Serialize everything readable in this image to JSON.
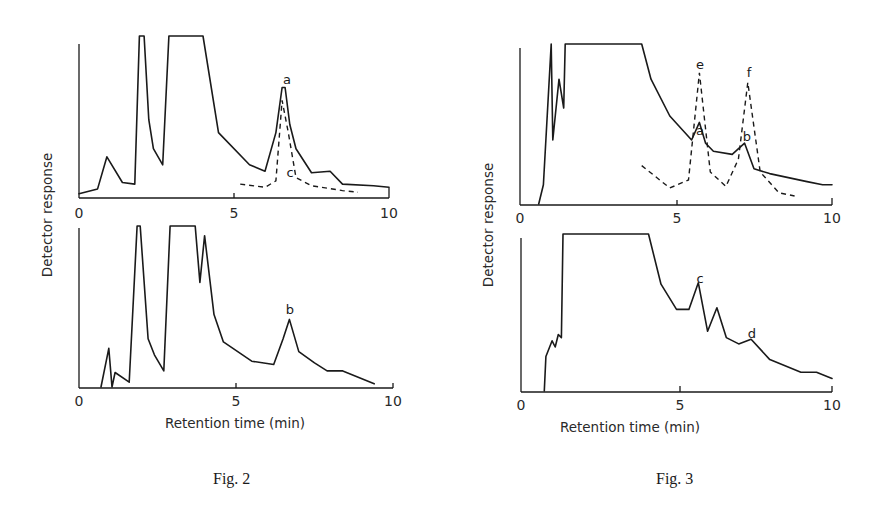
{
  "figures": [
    {
      "caption": "Fig. 2",
      "xlabel": "Retention time (min)",
      "ylabel": "Detector response",
      "panels": [
        {
          "x_ticks": [
            "0",
            "5",
            "10"
          ]
        },
        {
          "x_ticks": [
            "0",
            "5",
            "10"
          ]
        }
      ]
    },
    {
      "caption": "Fig. 3",
      "xlabel": "Retention time (min)",
      "ylabel": "Detector response",
      "panels": [
        {
          "x_ticks": [
            "0",
            "5",
            "10"
          ]
        },
        {
          "x_ticks": [
            "0",
            "5",
            "10"
          ]
        }
      ]
    }
  ],
  "chart_data": [
    {
      "type": "line",
      "title": "Fig. 2 (top panel)",
      "xlabel": "Retention time (min)",
      "ylabel": "Detector response",
      "xlim": [
        0,
        10
      ],
      "ylim": [
        0,
        1
      ],
      "x_ticks": [
        0,
        5,
        10
      ],
      "grid": false,
      "series": [
        {
          "name": "solid trace",
          "style": "solid",
          "x": [
            0,
            0.6,
            0.9,
            1.4,
            1.8,
            1.95,
            2.1,
            2.25,
            2.4,
            2.7,
            2.9,
            3.0,
            4.0,
            4.5,
            5.5,
            6.0,
            6.35,
            6.55,
            6.65,
            6.8,
            7.0,
            7.5,
            8.1,
            8.5,
            9.5,
            10.0
          ],
          "y": [
            0.02,
            0.05,
            0.25,
            0.09,
            0.08,
            1.0,
            1.0,
            0.48,
            0.3,
            0.2,
            1.0,
            1.0,
            1.0,
            0.4,
            0.2,
            0.16,
            0.4,
            0.68,
            0.68,
            0.45,
            0.3,
            0.15,
            0.16,
            0.08,
            0.07,
            0.06
          ],
          "labels": [
            {
              "text": "a",
              "x": 6.6
            }
          ]
        },
        {
          "name": "dashed trace",
          "style": "dashed",
          "x": [
            5.2,
            6.0,
            6.35,
            6.55,
            6.75,
            7.0,
            7.5,
            8.5,
            9.0
          ],
          "y": [
            0.08,
            0.06,
            0.1,
            0.6,
            0.4,
            0.12,
            0.07,
            0.04,
            0.03
          ],
          "labels": [
            {
              "text": "c",
              "x": 6.6
            }
          ]
        }
      ]
    },
    {
      "type": "line",
      "title": "Fig. 2 (bottom panel)",
      "xlabel": "Retention time (min)",
      "ylabel": "Detector response",
      "xlim": [
        0,
        10
      ],
      "ylim": [
        0,
        1
      ],
      "x_ticks": [
        0,
        5,
        10
      ],
      "grid": false,
      "series": [
        {
          "name": "solid trace",
          "style": "solid",
          "x": [
            0.7,
            0.95,
            1.05,
            1.15,
            1.6,
            1.85,
            1.95,
            2.2,
            2.4,
            2.7,
            2.9,
            3.0,
            3.7,
            3.85,
            4.0,
            4.3,
            4.6,
            5.5,
            6.2,
            6.5,
            6.7,
            7.0,
            7.5,
            7.9,
            8.4,
            9.4
          ],
          "y": [
            0.0,
            0.24,
            0.0,
            0.09,
            0.03,
            1.0,
            1.0,
            0.3,
            0.2,
            0.1,
            1.0,
            1.0,
            1.0,
            0.65,
            0.94,
            0.45,
            0.28,
            0.16,
            0.14,
            0.3,
            0.42,
            0.22,
            0.15,
            0.1,
            0.1,
            0.02
          ],
          "labels": [
            {
              "text": "b",
              "x": 6.7
            }
          ]
        }
      ]
    },
    {
      "type": "line",
      "title": "Fig. 3 (top panel)",
      "xlabel": "Retention time (min)",
      "ylabel": "Detector response",
      "xlim": [
        0,
        10
      ],
      "ylim": [
        0,
        1
      ],
      "x_ticks": [
        0,
        5,
        10
      ],
      "grid": false,
      "series": [
        {
          "name": "solid trace",
          "style": "solid",
          "x": [
            0.6,
            0.75,
            1.0,
            1.05,
            1.25,
            1.4,
            1.45,
            3.9,
            4.2,
            4.8,
            5.5,
            5.75,
            5.95,
            6.2,
            6.8,
            7.2,
            7.5,
            8.0,
            9.2,
            9.7,
            10.0
          ],
          "y": [
            0.0,
            0.12,
            1.0,
            0.4,
            0.78,
            0.6,
            1.0,
            1.0,
            0.78,
            0.55,
            0.4,
            0.51,
            0.38,
            0.33,
            0.31,
            0.38,
            0.22,
            0.19,
            0.14,
            0.12,
            0.12
          ],
          "labels": [
            {
              "text": "a",
              "x": 5.95
            },
            {
              "text": "b",
              "x": 7.2
            }
          ]
        },
        {
          "name": "dashed trace",
          "style": "dashed",
          "x": [
            3.9,
            4.8,
            5.4,
            5.75,
            6.1,
            6.6,
            7.0,
            7.3,
            7.7,
            8.3,
            8.8
          ],
          "y": [
            0.24,
            0.1,
            0.15,
            0.82,
            0.2,
            0.11,
            0.28,
            0.76,
            0.2,
            0.07,
            0.05
          ],
          "labels": [
            {
              "text": "e",
              "x": 5.75
            },
            {
              "text": "f",
              "x": 7.3
            }
          ]
        }
      ]
    },
    {
      "type": "line",
      "title": "Fig. 3 (bottom panel)",
      "xlabel": "Retention time (min)",
      "ylabel": "Detector response",
      "xlim": [
        0,
        10
      ],
      "ylim": [
        0,
        1
      ],
      "x_ticks": [
        0,
        5,
        10
      ],
      "grid": false,
      "series": [
        {
          "name": "solid trace",
          "style": "solid",
          "x": [
            0.75,
            0.8,
            1.0,
            1.1,
            1.2,
            1.3,
            1.35,
            4.1,
            4.5,
            5.0,
            5.4,
            5.7,
            6.0,
            6.3,
            6.6,
            7.0,
            7.4,
            8.0,
            9.0,
            9.5,
            10.0
          ],
          "y": [
            0.0,
            0.22,
            0.32,
            0.28,
            0.36,
            0.34,
            1.0,
            1.0,
            0.68,
            0.52,
            0.52,
            0.69,
            0.38,
            0.53,
            0.34,
            0.3,
            0.33,
            0.2,
            0.12,
            0.12,
            0.08
          ],
          "labels": [
            {
              "text": "c",
              "x": 5.7
            },
            {
              "text": "d",
              "x": 7.4
            }
          ]
        }
      ]
    }
  ]
}
